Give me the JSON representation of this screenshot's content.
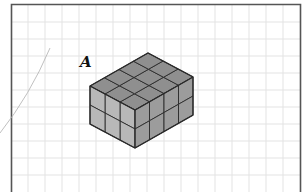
{
  "figure": {
    "label": "A",
    "cuboid": {
      "length_cubes": 4,
      "width_cubes": 3,
      "height_cubes": 2,
      "total_cubes": 24
    },
    "colors": {
      "top_face": "#8f8f8f",
      "left_face": "#b8b8b8",
      "right_face": "#9c9c9c",
      "edges": "#2a2a2a",
      "grid": "#e3e3e3",
      "frame": "#555555",
      "curve": "#b0b0b0"
    }
  }
}
